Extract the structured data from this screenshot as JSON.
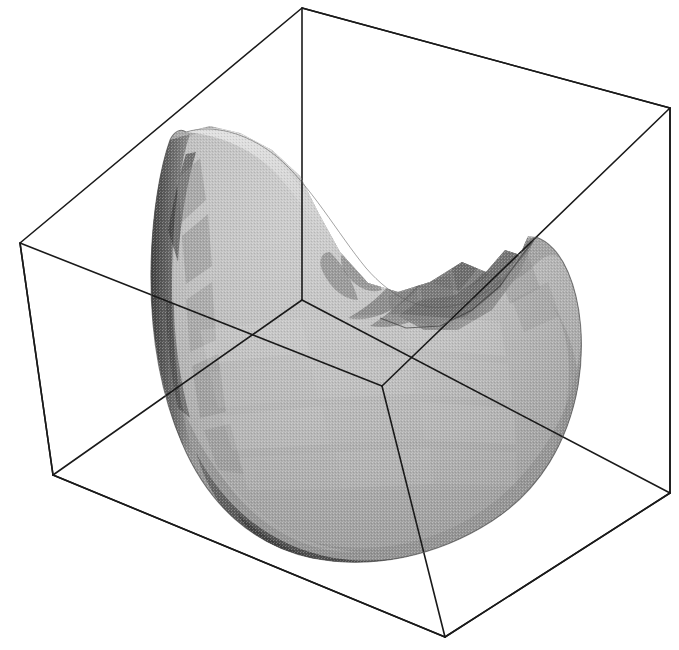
{
  "figure": {
    "title": "",
    "caption": "",
    "width": 679,
    "height": 650,
    "background_color": "#ffffff",
    "render_style": "dithered-grayscale-halftone"
  },
  "chart_data": {
    "type": "surface3d",
    "title": "",
    "subtitle": "",
    "xlabel": "",
    "ylabel": "",
    "zlabel": "",
    "legend": [],
    "annotations": [],
    "grid": false,
    "axis_ticks_visible": false,
    "axis_tick_labels": [],
    "colormap": "grayscale",
    "shading": "flat-faceted",
    "projection": "oblique-perspective",
    "bounding_box": {
      "visible": true,
      "line_color": "#1a1a1a",
      "line_width": 1.6,
      "corners_2d": {
        "back_top_left": [
          20,
          243
        ],
        "back_top_right": [
          302,
          8
        ],
        "front_top_right": [
          670,
          108
        ],
        "front_top_left": [
          382,
          386
        ],
        "back_bottom_left": [
          53,
          475
        ],
        "back_bottom_right": [
          302,
          300
        ],
        "front_bottom_right": [
          670,
          493
        ],
        "front_bottom_left": [
          445,
          637
        ]
      }
    },
    "surface_extent_2d": {
      "left": 150,
      "right": 585,
      "top": 118,
      "bottom": 560
    },
    "gray_levels": {
      "rim_highlight": "#d6d6d6",
      "inner_bowl_light": "#c2c2c2",
      "inner_bowl_mid": "#b0b0b0",
      "outer_body": "#9c9c9c",
      "outer_body_shadow": "#8a8a8a",
      "crease_shadow": "#6f6f6f",
      "deep_shadow": "#565656",
      "underside_dark": "#4a4a4a",
      "left_edge_dark": "#3f3f3f"
    }
  },
  "elements": {
    "plot_area_name": "surface-plot",
    "box_name": "bounding-box-wireframe",
    "surface_name": "shaded-surface-mesh"
  }
}
